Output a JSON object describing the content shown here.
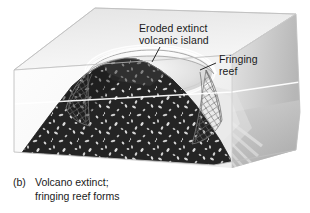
{
  "figure": {
    "panel_tag": "(b)",
    "caption_line_1": "Volcano extinct;",
    "caption_line_2": "fringing reef forms"
  },
  "labels": {
    "island": {
      "line_1": "Eroded extinct",
      "line_2": "volcanic island",
      "leader": "leader-line-to-summit"
    },
    "reef": {
      "line_1": "Fringing",
      "line_2": "reef",
      "leader": "leader-line-to-reef-rim"
    }
  },
  "scene": {
    "block_top_face": "sea-surface-top-face",
    "block_left_face": "water-left-face",
    "block_right_face": "water-right-face",
    "volcano": "eroded-volcanic-cone",
    "reef_ring": "fringing-reef-ring",
    "reef_net_left": "reef-mesh-left-flank",
    "reef_net_right": "reef-mesh-right-flank",
    "sea_surface_line": "sea-level-line",
    "lagoon": "shallow-lagoon-summit"
  },
  "colors": {
    "background": "#ffffff",
    "top_face": "#eeeeee",
    "left_face": "#fbfbfb",
    "right_face": "#d2d2d2",
    "right_face_dark": "#b4b4b4",
    "volcano_dark": "#242424",
    "volcano_speckle": "#d8d8d8",
    "reef_light": "#f2f2f2",
    "reef_outline": "#8a8a8a",
    "text": "#1a1a1a",
    "leader_line": "#111111"
  }
}
